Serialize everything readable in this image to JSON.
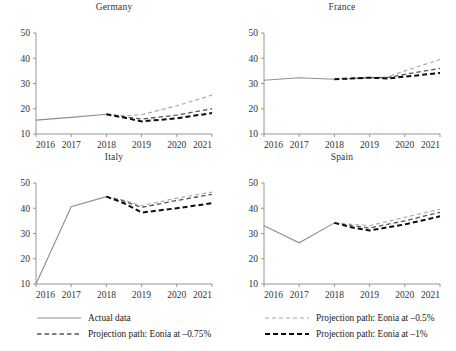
{
  "chart_data": {
    "type": "line",
    "title": "",
    "panels": [
      {
        "title": "Germany",
        "xlabel": "",
        "ylabel": "",
        "x": [
          2016,
          2017,
          2018,
          2019,
          2020,
          2021
        ],
        "xticks": [
          "2016",
          "2017",
          "2018",
          "2019",
          "2020",
          "2021"
        ],
        "yticks": [
          "10",
          "20",
          "30",
          "40",
          "50"
        ],
        "xlim": [
          2016,
          2021
        ],
        "ylim": [
          10,
          50
        ],
        "grid": false,
        "series": [
          {
            "name": "Actual data",
            "style": "actual",
            "x": [
              2016,
              2017,
              2018
            ],
            "values": [
              15.5,
              16.6,
              17.8
            ]
          },
          {
            "name": "Projection path: Eonia at -0.5%",
            "style": "p050",
            "x": [
              2018,
              2018.5,
              2019,
              2020,
              2021
            ],
            "values": [
              17.8,
              17.3,
              17.6,
              21.2,
              25.4
            ]
          },
          {
            "name": "Projection path: Eonia at -0.75%",
            "style": "p075",
            "x": [
              2018,
              2018.5,
              2019,
              2020,
              2021
            ],
            "values": [
              17.8,
              16.8,
              15.9,
              17.5,
              20.0
            ]
          },
          {
            "name": "Projection path: Eonia at -1%",
            "style": "p100",
            "x": [
              2018,
              2018.5,
              2019,
              2020,
              2021
            ],
            "values": [
              17.8,
              16.5,
              15.0,
              16.2,
              18.3
            ]
          }
        ]
      },
      {
        "title": "France",
        "xlabel": "",
        "ylabel": "",
        "x": [
          2016,
          2017,
          2018,
          2019,
          2020,
          2021
        ],
        "xticks": [
          "2016",
          "2017",
          "2018",
          "2019",
          "2020",
          "2021"
        ],
        "yticks": [
          "10",
          "20",
          "30",
          "40",
          "50"
        ],
        "xlim": [
          2016,
          2021
        ],
        "ylim": [
          10,
          50
        ],
        "grid": false,
        "series": [
          {
            "name": "Actual data",
            "style": "actual",
            "x": [
              2016,
              2017,
              2018
            ],
            "values": [
              31.3,
              32.3,
              31.7
            ]
          },
          {
            "name": "Projection path: Eonia at -0.5%",
            "style": "p050",
            "x": [
              2018,
              2019,
              2019.5,
              2020,
              2021
            ],
            "values": [
              31.7,
              32.3,
              32.6,
              35.0,
              39.5
            ]
          },
          {
            "name": "Projection path: Eonia at -0.75%",
            "style": "p075",
            "x": [
              2018,
              2019,
              2019.5,
              2020,
              2021
            ],
            "values": [
              31.7,
              32.3,
              32.3,
              33.6,
              36.0
            ]
          },
          {
            "name": "Projection path: Eonia at -1%",
            "style": "p100",
            "x": [
              2018,
              2019,
              2019.5,
              2020,
              2021
            ],
            "values": [
              31.7,
              32.3,
              32.0,
              32.7,
              34.2
            ]
          }
        ]
      },
      {
        "title": "Italy",
        "xlabel": "",
        "ylabel": "",
        "x": [
          2016,
          2017,
          2018,
          2019,
          2020,
          2021
        ],
        "xticks": [
          "2016",
          "2017",
          "2018",
          "2019",
          "2020",
          "2021"
        ],
        "yticks": [
          "10",
          "20",
          "30",
          "40",
          "50"
        ],
        "xlim": [
          2016,
          2021
        ],
        "ylim": [
          10,
          50
        ],
        "grid": false,
        "series": [
          {
            "name": "Actual data",
            "style": "actual",
            "x": [
              2016,
              2017,
              2018
            ],
            "values": [
              10.0,
              40.6,
              44.6
            ]
          },
          {
            "name": "Projection path: Eonia at -0.5%",
            "style": "p050",
            "x": [
              2018,
              2018.5,
              2019,
              2020,
              2021
            ],
            "values": [
              44.6,
              43.2,
              41.0,
              44.0,
              46.4
            ]
          },
          {
            "name": "Projection path: Eonia at -0.75%",
            "style": "p075",
            "x": [
              2018,
              2018.5,
              2019,
              2020,
              2021
            ],
            "values": [
              44.6,
              42.8,
              40.3,
              43.1,
              45.5
            ]
          },
          {
            "name": "Projection path: Eonia at -1%",
            "style": "p100",
            "x": [
              2018,
              2018.5,
              2019,
              2020,
              2021
            ],
            "values": [
              44.6,
              42.0,
              38.3,
              40.0,
              42.0
            ]
          }
        ]
      },
      {
        "title": "Spain",
        "xlabel": "",
        "ylabel": "",
        "x": [
          2016,
          2017,
          2018,
          2019,
          2020,
          2021
        ],
        "xticks": [
          "2016",
          "2017",
          "2018",
          "2019",
          "2020",
          "2021"
        ],
        "yticks": [
          "10",
          "20",
          "30",
          "40",
          "50"
        ],
        "xlim": [
          2016,
          2021
        ],
        "ylim": [
          10,
          50
        ],
        "grid": false,
        "series": [
          {
            "name": "Actual data",
            "style": "actual",
            "x": [
              2016,
              2017,
              2018
            ],
            "values": [
              33.1,
              26.3,
              34.2
            ]
          },
          {
            "name": "Projection path: Eonia at -0.5%",
            "style": "p050",
            "x": [
              2018,
              2018.5,
              2019,
              2020,
              2021
            ],
            "values": [
              34.2,
              33.6,
              33.1,
              36.4,
              39.6
            ]
          },
          {
            "name": "Projection path: Eonia at -0.75%",
            "style": "p075",
            "x": [
              2018,
              2018.5,
              2019,
              2020,
              2021
            ],
            "values": [
              34.2,
              33.0,
              32.2,
              35.0,
              38.4
            ]
          },
          {
            "name": "Projection path: Eonia at -1%",
            "style": "p100",
            "x": [
              2018,
              2018.5,
              2019,
              2020,
              2021
            ],
            "values": [
              34.2,
              32.4,
              31.2,
              33.6,
              36.8
            ]
          }
        ]
      }
    ],
    "legend": {
      "position": "bottom",
      "entries": [
        {
          "label": "Actual data",
          "style": "actual"
        },
        {
          "label": "Projection path: Eonia at –0.5%",
          "style": "p050"
        },
        {
          "label": "Projection path: Eonia at –0.75%",
          "style": "p075"
        },
        {
          "label": "Projection path: Eonia at –1%",
          "style": "p100"
        }
      ]
    },
    "colors": {
      "actual": "#8f8f8f",
      "p050": "#a8a8a8",
      "p075": "#555555",
      "p100": "#0d0d0d",
      "axis": "#8a8a8a",
      "text": "#1a1a1a",
      "background": "#ffffff"
    }
  }
}
